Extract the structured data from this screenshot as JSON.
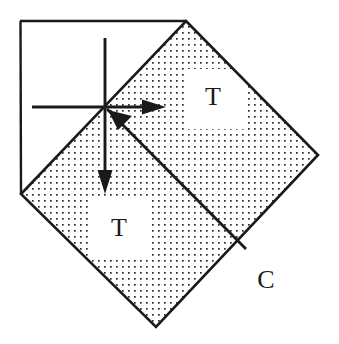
{
  "figure": {
    "kind": "geometry-diagram",
    "background_color": "#ffffff",
    "line_color": "#1a1a1a",
    "fill_pattern": "dotted-stipple",
    "dot_color": "#2b2b2b",
    "dot_spacing_px": 6,
    "dot_size_px": 1.6,
    "labels": {
      "region_upper": "T",
      "region_lower": "T",
      "outer_region": "C"
    },
    "shapes": {
      "outer_square_corner": {
        "name": "outer-square-partial",
        "top_left": [
          20,
          21
        ],
        "top_right": [
          186,
          21
        ],
        "bottom_left": [
          21,
          194
        ]
      },
      "diamond": {
        "name": "rotated-square",
        "vertex_top": [
          186,
          21
        ],
        "vertex_right": [
          318,
          155
        ],
        "vertex_bottom": [
          156,
          327
        ],
        "vertex_left": [
          21,
          194
        ]
      },
      "origin_point": [
        105,
        107
      ]
    },
    "arrows": {
      "right_arrow": {
        "name": "horizontal-arrow-right",
        "from": [
          32,
          107
        ],
        "to": [
          165,
          107
        ]
      },
      "down_arrow": {
        "name": "vertical-arrow-down",
        "from": [
          105,
          38
        ],
        "to": [
          105,
          193
        ]
      },
      "diagonal_arrow": {
        "name": "diagonal-arrow-up-left",
        "from": [
          245,
          248
        ],
        "to": [
          112,
          114
        ]
      }
    },
    "label_positions": {
      "region_upper": [
        213,
        98
      ],
      "region_lower": [
        119,
        229
      ],
      "outer_region": [
        266,
        281
      ]
    }
  }
}
